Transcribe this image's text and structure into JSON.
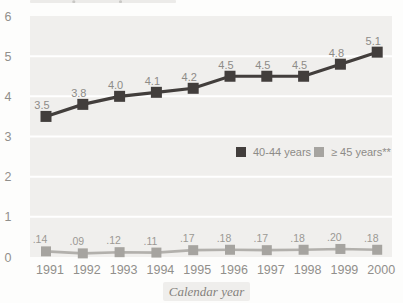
{
  "chart_data": {
    "type": "line",
    "title": "",
    "xlabel": "Calendar year",
    "ylabel": "",
    "categories": [
      "1991",
      "1992",
      "1993",
      "1994",
      "1995",
      "1996",
      "1997",
      "1998",
      "1999",
      "2000"
    ],
    "series": [
      {
        "name": "40-44 years",
        "color": "#423e3c",
        "marker": "square",
        "values": [
          3.5,
          3.8,
          4.0,
          4.1,
          4.2,
          4.5,
          4.5,
          4.5,
          4.8,
          5.1
        ],
        "point_labels": [
          "3.5",
          "3.8",
          "4.0",
          "4.1",
          "4.2",
          "4.5",
          "4.5",
          "4.5",
          "4.8",
          "5.1"
        ]
      },
      {
        "name": "≥ 45 years**",
        "color": "#b2b0ac",
        "marker_color": "#a6a4a0",
        "marker": "square",
        "values": [
          0.14,
          0.09,
          0.12,
          0.11,
          0.17,
          0.18,
          0.17,
          0.18,
          0.2,
          0.18
        ],
        "point_labels": [
          ".14",
          ".09",
          ".12",
          ".11",
          ".17",
          ".18",
          ".17",
          ".18",
          ".20",
          ".18"
        ]
      }
    ],
    "ylim": [
      0,
      6
    ],
    "yticks": [
      "0",
      "1",
      "2",
      "3",
      "4",
      "5",
      "6"
    ],
    "grid": "horizontal-white-lines-on-gray-bands",
    "legend_position": "inside-right-middle"
  },
  "colors": {
    "page_background": "#fdfdfc",
    "plot_band": "#f0efed",
    "gridline": "#ffffff",
    "tick_label": "#918f8b",
    "point_label_primary": "#8d8b87",
    "point_label_secondary": "#9b9994",
    "legend_text": "#8d8b87",
    "xlabel_text": "#85827d",
    "xlabel_box": "#efeeec"
  }
}
